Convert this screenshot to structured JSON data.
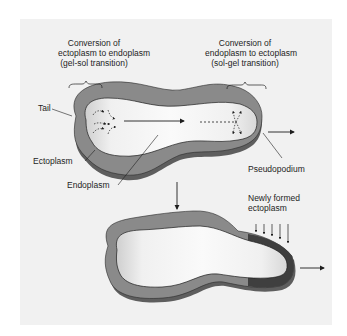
{
  "diagram": {
    "type": "amoeboid-movement",
    "colors": {
      "background": "#f1f1f1",
      "ectoplasm": "#8a8a8a",
      "ectoplasm_shadow": "#5e5e5e",
      "endoplasm_light": "#f7f7f7",
      "endoplasm_dark": "#c9c9c9",
      "new_ectoplasm": "#3f3f3f",
      "line": "#1e1e1e"
    },
    "top_left_caption": {
      "line1": "Conversion of",
      "line2": "ectoplasm to endoplasm",
      "line3": "(gel-sol transition)"
    },
    "top_right_caption": {
      "line1": "Conversion of",
      "line2": "endoplasm to ectoplasm",
      "line3": "(sol-gel transition)"
    },
    "labels": {
      "tail": "Tail",
      "ectoplasm": "Ectoplasm",
      "endoplasm": "Endoplasm",
      "pseudopodium": "Pseudopodium",
      "newly_formed_line1": "Newly formed",
      "newly_formed_line2": "ectoplasm"
    }
  }
}
